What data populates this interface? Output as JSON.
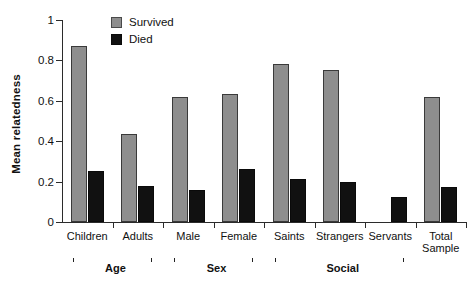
{
  "chart_data": {
    "type": "bar",
    "title": "",
    "subtitle": "",
    "xlabel": "",
    "ylabel": "Mean relatedness",
    "ylim": [
      0,
      1
    ],
    "yticks": [
      "0",
      "0.2",
      "0.4",
      "0.6",
      "0.8",
      "1"
    ],
    "ytick_values": [
      0,
      0.2,
      0.4,
      0.6,
      0.8,
      1
    ],
    "grid": false,
    "legend_position": "top-left-inside",
    "categories": [
      "Children",
      "Adults",
      "Male",
      "Female",
      "Saints",
      "Strangers",
      "Servants",
      "Total\nSample"
    ],
    "series": [
      {
        "name": "Survived",
        "color": "#8e8e8e",
        "values": [
          0.87,
          0.435,
          0.62,
          0.635,
          0.78,
          0.75,
          null,
          0.62
        ]
      },
      {
        "name": "Died",
        "color": "#111111",
        "values": [
          0.25,
          0.18,
          0.16,
          0.26,
          0.215,
          0.2,
          0.125,
          0.175
        ]
      }
    ],
    "group_brackets": [
      {
        "label": "Age",
        "from": 0,
        "to": 1
      },
      {
        "label": "Sex",
        "from": 2,
        "to": 3
      },
      {
        "label": "Social",
        "from": 4,
        "to": 6
      }
    ]
  },
  "legend": {
    "items": [
      {
        "label": "Survived",
        "swatch": "gray-square-icon"
      },
      {
        "label": "Died",
        "swatch": "black-square-icon"
      }
    ]
  },
  "axes": {
    "y_title": "Mean relatedness",
    "y_ticks": [
      "1",
      "0.8",
      "0.6",
      "0.4",
      "0.2",
      "0"
    ]
  }
}
